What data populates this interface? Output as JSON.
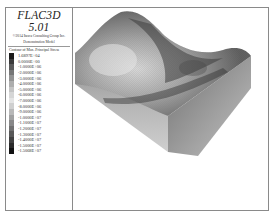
{
  "app": {
    "title": "FLAC3D 5.01",
    "copyright": "©2014 Itasca Consulting Group Inc.",
    "model_label": "Demonstration Model"
  },
  "legend": {
    "title": "Contour of Max. Principal Stress",
    "entries": [
      {
        "label": "1.6897E+04",
        "color": "#1a1a1a"
      },
      {
        "label": "0.0000E+00",
        "color": "#3a3a3a"
      },
      {
        "label": "-1.0000E+06",
        "color": "#5a5a5a"
      },
      {
        "label": "-2.0000E+06",
        "color": "#777777"
      },
      {
        "label": "-3.0000E+06",
        "color": "#939393"
      },
      {
        "label": "-4.0000E+06",
        "color": "#adadad"
      },
      {
        "label": "-5.0000E+06",
        "color": "#c4c4c4"
      },
      {
        "label": "-6.0000E+06",
        "color": "#d6d6d6"
      },
      {
        "label": "-7.0000E+06",
        "color": "#e4e4e4"
      },
      {
        "label": "-8.0000E+06",
        "color": "#cfcfcf"
      },
      {
        "label": "-9.0000E+06",
        "color": "#b8b8b8"
      },
      {
        "label": "-1.0000E+07",
        "color": "#a0a0a0"
      },
      {
        "label": "-1.1000E+07",
        "color": "#888888"
      },
      {
        "label": "-1.2000E+07",
        "color": "#707070"
      },
      {
        "label": "-1.3000E+07",
        "color": "#585858"
      },
      {
        "label": "-1.4000E+07",
        "color": "#404040"
      },
      {
        "label": "-1.5000E+07",
        "color": "#2a2a2a"
      },
      {
        "label": "-1.5068E+07",
        "color": "#111111"
      }
    ]
  },
  "viewport": {
    "model": "3D contoured terrain block"
  }
}
